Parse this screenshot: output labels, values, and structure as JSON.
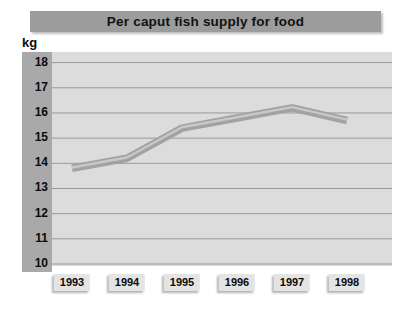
{
  "header": {
    "title": "Per caput fish supply for food",
    "bg_color": "#9c9c9c",
    "text_color": "#111111"
  },
  "chart_data": {
    "type": "line",
    "title": "Per caput fish supply for food",
    "ylabel": "kg",
    "xlabel": "",
    "categories": [
      "1993",
      "1994",
      "1995",
      "1996",
      "1997",
      "1998"
    ],
    "series": [
      {
        "name": "Per caput fish supply",
        "values": [
          13.8,
          14.2,
          15.4,
          15.8,
          16.2,
          15.7
        ]
      }
    ],
    "ylim": [
      10,
      18
    ],
    "ytick_step": 1,
    "yticks": [
      18,
      17,
      16,
      15,
      14,
      13,
      12,
      11,
      10
    ],
    "grid": true,
    "legend": false,
    "colors": {
      "plot_bg": "#dcdcdc",
      "axis_band_bg": "#a9a9a9",
      "gridline": "#9a9a9a",
      "line_outer": "#a2a2a2",
      "line_highlight": "#c8c8c8",
      "tick_box_bg": "#e4e4e4",
      "text": "#0a0a0a"
    }
  }
}
